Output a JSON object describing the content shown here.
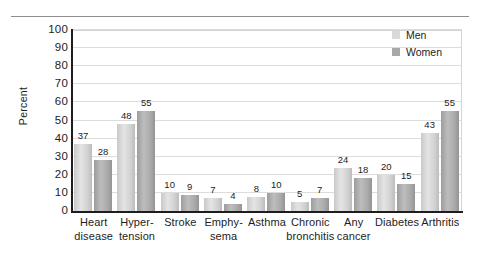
{
  "chart_data": {
    "type": "bar",
    "title": "",
    "subtitle": "",
    "xlabel": "",
    "ylabel": "Percent",
    "ylim": [
      0,
      100
    ],
    "ytick_values": [
      0,
      10,
      20,
      30,
      40,
      50,
      60,
      70,
      80,
      90,
      100
    ],
    "ytick_labels": [
      "0",
      "10",
      "20",
      "30",
      "40",
      "50",
      "60",
      "70",
      "80",
      "90",
      "100"
    ],
    "grid": "horizontal",
    "legend_position": "top-right",
    "categories": [
      "Heart disease",
      "Hyper-tension",
      "Stroke",
      "Emphy-sema",
      "Asthma",
      "Chronic bronchitis",
      "Any cancer",
      "Diabetes",
      "Arthritis"
    ],
    "category_lines": [
      [
        "Heart",
        "disease"
      ],
      [
        "Hyper-",
        "tension"
      ],
      [
        "Stroke",
        ""
      ],
      [
        "Emphy-",
        "sema"
      ],
      [
        "Asthma",
        ""
      ],
      [
        "Chronic",
        "bronchitis"
      ],
      [
        "Any",
        "cancer"
      ],
      [
        "Diabetes",
        ""
      ],
      [
        "Arthritis",
        ""
      ]
    ],
    "series": [
      {
        "name": "Men",
        "color": "#d9d9d9",
        "values": [
          37,
          48,
          10,
          7,
          8,
          5,
          24,
          20,
          43
        ]
      },
      {
        "name": "Women",
        "color": "#a8a8a8",
        "values": [
          28,
          55,
          9,
          4,
          10,
          7,
          18,
          15,
          55
        ]
      }
    ],
    "value_labels": {
      "Men": [
        "37",
        "48",
        "10",
        "7",
        "8",
        "5",
        "24",
        "20",
        "43"
      ],
      "Women": [
        "28",
        "55",
        "9",
        "4",
        "10",
        "7",
        "18",
        "15",
        "55"
      ]
    }
  },
  "legend": {
    "items": [
      {
        "label": "Men"
      },
      {
        "label": "Women"
      }
    ]
  },
  "colors": {
    "men_bar": "#d9d9d9",
    "women_bar": "#a8a8a8",
    "axis": "#1d1d1d",
    "gridline": "#dcdcdc",
    "background": "#ffffff"
  }
}
